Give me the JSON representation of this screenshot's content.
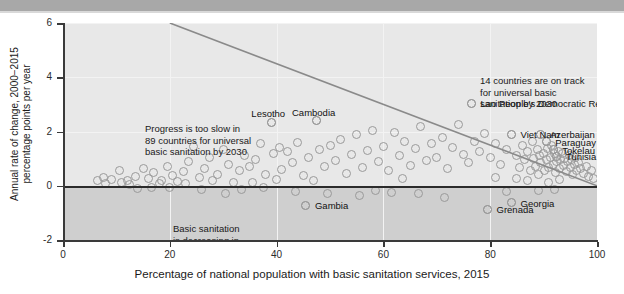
{
  "chart_data": {
    "type": "scatter",
    "title": "",
    "xlabel": "Percentage of national population with basic sanitation services, 2015",
    "ylabel": "Annual rate of change, 2000−2015\npercentage points per year",
    "ylabel_line1": "Annual rate of change, 2000−2015",
    "ylabel_line2": "percentage points per year",
    "xlim": [
      0,
      100
    ],
    "ylim": [
      -2,
      6
    ],
    "xticks": [
      0,
      20,
      40,
      60,
      80,
      100
    ],
    "yticks": [
      -2,
      0,
      2,
      4,
      6
    ],
    "xticklabels": [
      "0",
      "20",
      "40",
      "60",
      "80",
      "100"
    ],
    "yticklabels": [
      "-2",
      "0",
      "2",
      "4",
      "6"
    ],
    "grid": true,
    "legend": "none",
    "zero_reference_line": 0,
    "trend_line": {
      "name": "on-track threshold",
      "x": [
        20,
        100
      ],
      "y": [
        6,
        0
      ],
      "color": "#8a8a8a"
    },
    "annotations": [
      {
        "name": "progress-too-slow",
        "text": "Progress is too slow in\n89 countries for universal\nbasic sanitation by 2030",
        "x": 10,
        "y": 2.9
      },
      {
        "name": "basic-sanitation-decreasing",
        "text": "Basic sanitation\nis decreasing in\n20 countries",
        "x": 15,
        "y": -0.5
      },
      {
        "name": "on-track",
        "text": "14 countries are on track\nfor universal basic\nsanitation by 2030",
        "x": 66,
        "y": 4.7
      }
    ],
    "labeled_points": [
      {
        "label": "Lesotho",
        "x": 39.0,
        "y": 2.35,
        "label_dx": -3,
        "label_dy": -14
      },
      {
        "label": "Cambodia",
        "x": 47.5,
        "y": 2.4,
        "label_dx": -3,
        "label_dy": -14
      },
      {
        "label": "Lao People's Democratic Republic",
        "x": 76.5,
        "y": 3.05,
        "label_dx": 9,
        "label_dy": -5
      },
      {
        "label": "Viet Nam",
        "x": 84.0,
        "y": 1.9,
        "label_dx": 9,
        "label_dy": -5
      },
      {
        "label": "Azerbaijan",
        "x": 89.5,
        "y": 1.9,
        "label_dx": 9,
        "label_dy": -5
      },
      {
        "label": "Paraguay",
        "x": 90.5,
        "y": 1.62,
        "label_dx": 9,
        "label_dy": -5
      },
      {
        "label": "Tokelau",
        "x": 91.8,
        "y": 1.33,
        "label_dx": 9,
        "label_dy": -5
      },
      {
        "label": "Tunisia",
        "x": 92.5,
        "y": 1.08,
        "label_dx": 9,
        "label_dy": -5
      },
      {
        "label": "Gambia",
        "x": 45.5,
        "y": -0.72,
        "label_dx": 9,
        "label_dy": -5
      },
      {
        "label": "Grenada",
        "x": 79.5,
        "y": -0.86,
        "label_dx": 9,
        "label_dy": -5
      },
      {
        "label": "Georgia",
        "x": 84.0,
        "y": -0.62,
        "label_dx": 9,
        "label_dy": -5
      }
    ],
    "points": [
      [
        7.5,
        0.3
      ],
      [
        9.0,
        0.22
      ],
      [
        10.5,
        0.55
      ],
      [
        12.0,
        0.18
      ],
      [
        13.5,
        0.35
      ],
      [
        15.0,
        0.62
      ],
      [
        16.0,
        0.28
      ],
      [
        17.0,
        0.48
      ],
      [
        18.5,
        0.2
      ],
      [
        19.5,
        0.72
      ],
      [
        20.5,
        0.36
      ],
      [
        21.5,
        0.15
      ],
      [
        12.5,
        0.05
      ],
      [
        14.0,
        -0.1
      ],
      [
        16.5,
        -0.05
      ],
      [
        18.0,
        0.08
      ],
      [
        22.5,
        0.52
      ],
      [
        23.5,
        0.9
      ],
      [
        24.5,
        1.45
      ],
      [
        25.5,
        0.3
      ],
      [
        26.5,
        0.65
      ],
      [
        27.5,
        1.05
      ],
      [
        28.0,
        0.2
      ],
      [
        29.0,
        0.42
      ],
      [
        30.0,
        1.32
      ],
      [
        31.0,
        0.8
      ],
      [
        32.0,
        0.12
      ],
      [
        33.0,
        0.55
      ],
      [
        34.0,
        1.1
      ],
      [
        35.0,
        0.7
      ],
      [
        30.5,
        -0.28
      ],
      [
        33.5,
        -0.15
      ],
      [
        36.0,
        0.95
      ],
      [
        37.0,
        1.55
      ],
      [
        38.0,
        0.4
      ],
      [
        39.0,
        2.35
      ],
      [
        39.5,
        1.18
      ],
      [
        40.5,
        1.42
      ],
      [
        41.0,
        0.6
      ],
      [
        42.0,
        1.25
      ],
      [
        43.0,
        0.85
      ],
      [
        44.0,
        1.6
      ],
      [
        45.0,
        0.38
      ],
      [
        45.5,
        -0.72
      ],
      [
        46.0,
        1.05
      ],
      [
        47.5,
        2.4
      ],
      [
        48.0,
        1.35
      ],
      [
        49.0,
        0.72
      ],
      [
        50.0,
        1.5
      ],
      [
        51.0,
        0.92
      ],
      [
        52.0,
        1.7
      ],
      [
        53.0,
        0.45
      ],
      [
        54.0,
        1.15
      ],
      [
        55.0,
        1.88
      ],
      [
        56.0,
        0.68
      ],
      [
        57.0,
        1.3
      ],
      [
        58.0,
        2.05
      ],
      [
        59.0,
        0.88
      ],
      [
        60.0,
        1.45
      ],
      [
        61.0,
        0.55
      ],
      [
        55.5,
        -0.35
      ],
      [
        58.5,
        -0.18
      ],
      [
        62.0,
        1.95
      ],
      [
        63.0,
        1.12
      ],
      [
        64.0,
        1.62
      ],
      [
        65.0,
        0.75
      ],
      [
        66.0,
        1.38
      ],
      [
        67.0,
        2.18
      ],
      [
        68.0,
        0.92
      ],
      [
        69.0,
        1.55
      ],
      [
        70.0,
        1.05
      ],
      [
        71.0,
        1.78
      ],
      [
        72.0,
        0.62
      ],
      [
        73.0,
        1.42
      ],
      [
        74.0,
        2.25
      ],
      [
        75.0,
        1.15
      ],
      [
        76.0,
        0.85
      ],
      [
        76.5,
        3.05
      ],
      [
        77.0,
        1.62
      ],
      [
        78.0,
        1.28
      ],
      [
        79.0,
        1.92
      ],
      [
        79.5,
        -0.86
      ],
      [
        80.0,
        1.05
      ],
      [
        81.0,
        1.55
      ],
      [
        82.0,
        0.78
      ],
      [
        83.0,
        1.35
      ],
      [
        84.0,
        1.9
      ],
      [
        84.0,
        -0.62
      ],
      [
        85.0,
        1.12
      ],
      [
        85.5,
        0.68
      ],
      [
        86.0,
        1.48
      ],
      [
        86.5,
        0.95
      ],
      [
        87.0,
        1.25
      ],
      [
        87.5,
        0.55
      ],
      [
        88.0,
        1.62
      ],
      [
        88.2,
        1.02
      ],
      [
        88.5,
        0.72
      ],
      [
        88.8,
        1.32
      ],
      [
        89.0,
        0.42
      ],
      [
        89.2,
        1.1
      ],
      [
        89.5,
        1.9
      ],
      [
        89.5,
        0.85
      ],
      [
        90.0,
        1.2
      ],
      [
        90.2,
        0.58
      ],
      [
        90.5,
        1.62
      ],
      [
        90.5,
        0.95
      ],
      [
        90.8,
        1.38
      ],
      [
        91.0,
        0.68
      ],
      [
        91.2,
        1.05
      ],
      [
        91.5,
        1.48
      ],
      [
        91.8,
        1.33
      ],
      [
        91.8,
        0.78
      ],
      [
        92.0,
        1.18
      ],
      [
        92.2,
        0.48
      ],
      [
        92.5,
        1.08
      ],
      [
        92.5,
        0.88
      ],
      [
        92.8,
        1.28
      ],
      [
        93.0,
        0.62
      ],
      [
        93.2,
        0.98
      ],
      [
        93.5,
        1.18
      ],
      [
        93.8,
        0.75
      ],
      [
        94.0,
        1.02
      ],
      [
        94.2,
        0.52
      ],
      [
        94.5,
        0.88
      ],
      [
        94.8,
        1.12
      ],
      [
        95.0,
        0.68
      ],
      [
        95.2,
        0.95
      ],
      [
        95.5,
        0.42
      ],
      [
        95.8,
        0.78
      ],
      [
        96.0,
        1.05
      ],
      [
        96.2,
        0.58
      ],
      [
        96.5,
        0.85
      ],
      [
        97.0,
        0.65
      ],
      [
        97.5,
        0.45
      ],
      [
        98.0,
        0.72
      ],
      [
        98.5,
        0.35
      ],
      [
        91.0,
        0.12
      ],
      [
        92.0,
        -0.12
      ],
      [
        93.0,
        0.22
      ],
      [
        89.0,
        -0.18
      ],
      [
        87.0,
        0.18
      ],
      [
        85.0,
        0.25
      ],
      [
        83.0,
        -0.22
      ],
      [
        81.0,
        0.32
      ],
      [
        71.5,
        -0.42
      ],
      [
        66.5,
        -0.3
      ],
      [
        63.5,
        0.25
      ],
      [
        61.5,
        -0.25
      ],
      [
        49.5,
        -0.3
      ],
      [
        47.0,
        0.18
      ],
      [
        43.5,
        -0.22
      ],
      [
        40.0,
        0.22
      ],
      [
        37.5,
        -0.08
      ],
      [
        35.5,
        0.12
      ],
      [
        26.0,
        -0.12
      ],
      [
        23.0,
        0.08
      ],
      [
        20.0,
        -0.05
      ],
      [
        11.0,
        0.12
      ],
      [
        8.0,
        0.08
      ],
      [
        6.5,
        0.18
      ],
      [
        99.0,
        0.55
      ],
      [
        99.3,
        0.28
      ]
    ]
  }
}
